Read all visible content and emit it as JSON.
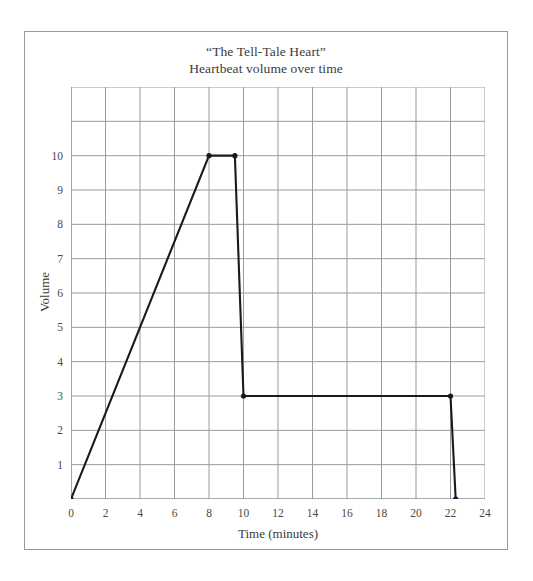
{
  "chart_data": {
    "type": "line",
    "title": "“The Tell-Tale Heart”",
    "subtitle": "Heartbeat volume over time",
    "xlabel": "Time (minutes)",
    "ylabel": "Volume",
    "xlim": [
      0,
      24
    ],
    "ylim": [
      0,
      12
    ],
    "xticks": [
      0,
      2,
      4,
      6,
      8,
      10,
      12,
      14,
      16,
      18,
      20,
      22,
      24
    ],
    "yticks": [
      1,
      2,
      3,
      4,
      5,
      6,
      7,
      8,
      9,
      10
    ],
    "xtick_labels": [
      "0",
      "2",
      "4",
      "6",
      "8",
      "10",
      "12",
      "14",
      "16",
      "18",
      "20",
      "22",
      "24"
    ],
    "ytick_labels": [
      "1",
      "2",
      "3",
      "4",
      "5",
      "6",
      "7",
      "8",
      "9",
      "10"
    ],
    "grid": true,
    "grid_x_step": 2,
    "grid_y_step": 1,
    "legend": false,
    "line_color": "#1a1a1a",
    "grid_color": "#9b9b9b",
    "axis_color": "#8a8a8a",
    "series": [
      {
        "name": "Heartbeat volume",
        "points": [
          {
            "x": 0,
            "y": 0
          },
          {
            "x": 8,
            "y": 10
          },
          {
            "x": 9.5,
            "y": 10
          },
          {
            "x": 10,
            "y": 3
          },
          {
            "x": 22,
            "y": 3
          },
          {
            "x": 22.3,
            "y": 0
          }
        ]
      }
    ],
    "markers": [
      {
        "x": 0,
        "y": 0
      },
      {
        "x": 8,
        "y": 10
      },
      {
        "x": 9.5,
        "y": 10
      },
      {
        "x": 10,
        "y": 3
      },
      {
        "x": 22,
        "y": 3
      },
      {
        "x": 22.3,
        "y": 0
      }
    ]
  }
}
